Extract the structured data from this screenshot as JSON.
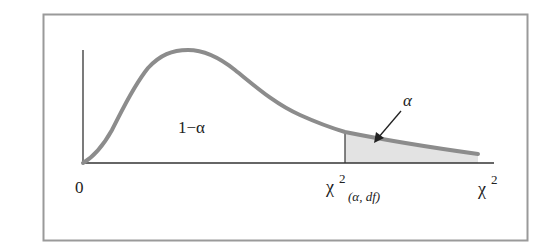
{
  "figure": {
    "labels": {
      "origin": "0",
      "area_left": "1−α",
      "area_right": "α",
      "critical_value_symbol": "χ",
      "critical_value_sup": "2",
      "critical_value_sub": "(α, df)",
      "x_axis_symbol": "χ",
      "x_axis_sup": "2"
    },
    "colors": {
      "frame": "#9a9a9a",
      "curve": "#8c8c8c",
      "axes": "#333333",
      "shade": "#e3e3e3",
      "text": "#222222"
    }
  }
}
